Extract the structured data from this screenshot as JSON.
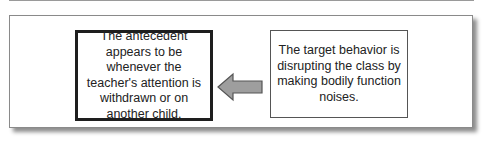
{
  "diagram": {
    "type": "flow",
    "left_box": {
      "role": "antecedent",
      "text": "The antecedent appears to be whenever the teacher's attention is withdrawn or on another child."
    },
    "right_box": {
      "role": "target-behavior",
      "text": "The target behavior is disrupting the class by making bodily function noises."
    },
    "arrow": {
      "direction": "left",
      "from": "right_box",
      "to": "left_box",
      "fill": "#9e9e9e",
      "stroke": "#555555"
    }
  }
}
